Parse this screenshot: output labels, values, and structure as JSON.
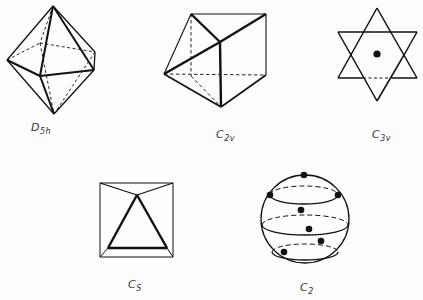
{
  "figure": {
    "shapes": [
      {
        "id": "d5h",
        "name": "pentagonal bipyramid",
        "label_main": "D",
        "label_sub": "5h"
      },
      {
        "id": "c2v",
        "name": "triangular prism (capped)",
        "label_main": "C",
        "label_sub": "2v"
      },
      {
        "id": "c3v",
        "name": "hexagram with center dot",
        "label_main": "C",
        "label_sub": "3v"
      },
      {
        "id": "cs",
        "name": "square with inscribed triangle",
        "label_main": "C",
        "label_sub": "S"
      },
      {
        "id": "c2",
        "name": "sphere with points on latitude circles",
        "label_main": "C",
        "label_sub": "2"
      }
    ]
  },
  "colors": {
    "line": "#111111",
    "background": "#fdfdfd",
    "label": "#333333"
  }
}
